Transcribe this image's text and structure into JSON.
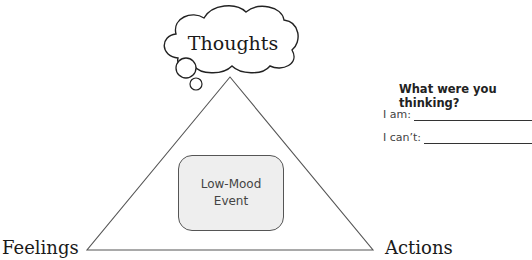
{
  "diagram": {
    "title_node": "Thoughts",
    "left_node": "Feelings",
    "right_node": "Actions",
    "center_box": {
      "line1": "Low-Mood",
      "line2": "Event"
    }
  },
  "worksheet": {
    "question": "What were you thinking?",
    "prompts": [
      {
        "label": "I am:"
      },
      {
        "label": "I can’t:"
      }
    ]
  },
  "colors": {
    "stroke": "#333333",
    "box_fill": "#eeeeee",
    "text": "#1a1a1a"
  }
}
